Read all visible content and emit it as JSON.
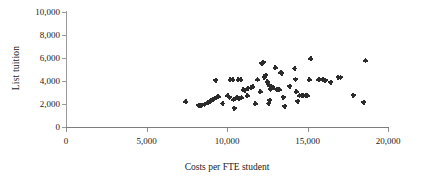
{
  "chart_data": {
    "type": "scatter",
    "title": "",
    "xlabel": "Costs per FTE student",
    "ylabel": "List tuition",
    "xlim": [
      0,
      20000
    ],
    "ylim": [
      0,
      10000
    ],
    "xticks": [
      0,
      5000,
      10000,
      15000,
      20000
    ],
    "yticks": [
      0,
      2000,
      4000,
      6000,
      8000,
      10000
    ],
    "xtick_labels": [
      "0",
      "5,000",
      "10,000",
      "15,000",
      "20,000"
    ],
    "ytick_labels": [
      "0",
      "2,000",
      "4,000",
      "6,000",
      "8,000",
      "10,000"
    ],
    "grid": false,
    "legend": null,
    "marker": "cross-dot",
    "marker_color": "#2b2b2b",
    "points": [
      [
        7450,
        2180
      ],
      [
        8250,
        1880
      ],
      [
        8400,
        1900
      ],
      [
        8600,
        2000
      ],
      [
        8800,
        2100
      ],
      [
        8950,
        2250
      ],
      [
        9100,
        2400
      ],
      [
        9150,
        2430
      ],
      [
        9350,
        2600
      ],
      [
        9450,
        2620
      ],
      [
        9300,
        4080
      ],
      [
        9750,
        2050
      ],
      [
        10050,
        2720
      ],
      [
        10150,
        2600
      ],
      [
        10200,
        4120
      ],
      [
        10350,
        4100
      ],
      [
        10400,
        2350
      ],
      [
        10450,
        1640
      ],
      [
        10700,
        4100
      ],
      [
        10850,
        4110
      ],
      [
        10600,
        2550
      ],
      [
        10750,
        2520
      ],
      [
        10900,
        2530
      ],
      [
        11000,
        3250
      ],
      [
        11100,
        3180
      ],
      [
        11250,
        2720
      ],
      [
        11300,
        3350
      ],
      [
        11500,
        3400
      ],
      [
        11600,
        3500
      ],
      [
        11750,
        2020
      ],
      [
        11900,
        4120
      ],
      [
        12050,
        3050
      ],
      [
        12150,
        5550
      ],
      [
        12250,
        5620
      ],
      [
        12300,
        4320
      ],
      [
        12400,
        4500
      ],
      [
        12500,
        3920
      ],
      [
        12550,
        3700
      ],
      [
        12600,
        2050
      ],
      [
        12650,
        2320
      ],
      [
        12700,
        3280
      ],
      [
        12750,
        3500
      ],
      [
        12850,
        3450
      ],
      [
        13000,
        5150
      ],
      [
        13100,
        3300
      ],
      [
        13250,
        3250
      ],
      [
        13350,
        4700
      ],
      [
        13400,
        4680
      ],
      [
        13500,
        2600
      ],
      [
        13600,
        1800
      ],
      [
        13900,
        3560
      ],
      [
        14200,
        5080
      ],
      [
        14250,
        4150
      ],
      [
        14300,
        3050
      ],
      [
        14400,
        2250
      ],
      [
        14500,
        2700
      ],
      [
        14650,
        2700
      ],
      [
        14750,
        2720
      ],
      [
        14900,
        2700
      ],
      [
        15000,
        2720
      ],
      [
        15100,
        4100
      ],
      [
        15200,
        5920
      ],
      [
        15700,
        4100
      ],
      [
        15950,
        4150
      ],
      [
        16100,
        4080
      ],
      [
        16450,
        3900
      ],
      [
        16900,
        4330
      ],
      [
        17050,
        4320
      ],
      [
        17850,
        2750
      ],
      [
        18500,
        2150
      ],
      [
        18600,
        5760
      ]
    ]
  },
  "axes": {
    "ylabel_text": "List tuition",
    "xlabel_text": "Costs per FTE student"
  }
}
